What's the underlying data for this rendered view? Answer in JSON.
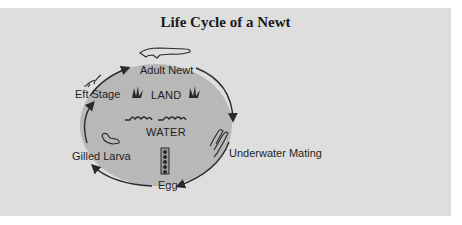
{
  "title": "Life Cycle of a Newt",
  "colors": {
    "panel_bg": "#dedede",
    "circle_fill": "#b8b8b8",
    "stroke": "#2a2a2a"
  },
  "zones": {
    "land": "LAND",
    "water": "WATER"
  },
  "stages": [
    {
      "id": "adult-newt",
      "label": "Adult Newt",
      "icon": "adult-newt-icon"
    },
    {
      "id": "underwater-mating",
      "label": "Underwater Mating",
      "icon": "mating-newts-icon"
    },
    {
      "id": "egg",
      "label": "Egg",
      "icon": "egg-strand-icon"
    },
    {
      "id": "gilled-larva",
      "label": "Gilled Larva",
      "icon": "larva-icon"
    },
    {
      "id": "eft-stage",
      "label": "Eft Stage",
      "icon": "eft-icon"
    }
  ],
  "cycle_direction": "clockwise"
}
